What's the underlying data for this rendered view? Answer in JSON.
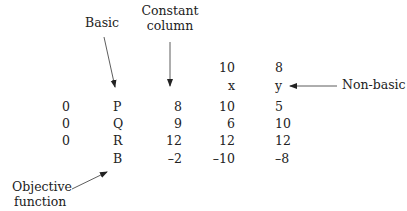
{
  "annotations": {
    "basic": "Basic",
    "constant_column_line1": "Constant",
    "constant_column_line2": "column",
    "non_basic": "Non-basic",
    "objective_line1": "Objective",
    "objective_line2": "function"
  },
  "header": {
    "coefficients": [
      "10",
      "8"
    ],
    "variables": [
      "x",
      "y"
    ]
  },
  "rows": [
    {
      "cb": "0",
      "basic": "P",
      "constant": "8",
      "x": "10",
      "y": "5"
    },
    {
      "cb": "0",
      "basic": "Q",
      "constant": "9",
      "x": "6",
      "y": "10"
    },
    {
      "cb": "0",
      "basic": "R",
      "constant": "12",
      "x": "12",
      "y": "12"
    },
    {
      "cb": "",
      "basic": "B",
      "constant": "–2",
      "x": "–10",
      "y": "–8"
    }
  ]
}
